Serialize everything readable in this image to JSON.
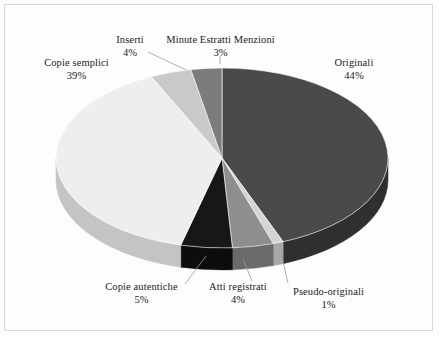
{
  "chart_data": {
    "type": "pie",
    "title": "",
    "subtitle": "",
    "xlabel": "",
    "ylabel": "",
    "legend_position": "none",
    "grid": false,
    "three_d": true,
    "start_angle_deg": 0,
    "direction": "clockwise",
    "units": "percent",
    "categories": [
      "Originali",
      "Pseudo-originali",
      "Atti registrati",
      "Copie autentiche",
      "Copie semplici",
      "Inserti",
      "Minute Estratti Menzioni"
    ],
    "values": [
      44,
      1,
      4,
      5,
      39,
      4,
      3
    ],
    "slices": [
      {
        "label": "Originali",
        "pct_text": "44%",
        "value": 44,
        "color": "#4a4a4a",
        "side_color": "#2f2f2f"
      },
      {
        "label": "Pseudo-originali",
        "pct_text": "1%",
        "value": 1,
        "color": "#d4d4d4",
        "side_color": "#a8a8a8"
      },
      {
        "label": "Atti registrati",
        "pct_text": "4%",
        "value": 4,
        "color": "#8e8e8e",
        "side_color": "#6a6a6a"
      },
      {
        "label": "Copie autentiche",
        "pct_text": "5%",
        "value": 5,
        "color": "#171717",
        "side_color": "#0d0d0d"
      },
      {
        "label": "Copie semplici",
        "pct_text": "39%",
        "value": 39,
        "color": "#eeeeee",
        "side_color": "#c4c4c4"
      },
      {
        "label": "Inserti",
        "pct_text": "4%",
        "value": 4,
        "color": "#c9c9c9",
        "side_color": "#a0a0a0"
      },
      {
        "label": "Minute Estratti Menzioni",
        "pct_text": "3%",
        "value": 3,
        "color": "#7c7c7c",
        "side_color": "#5a5a5a"
      }
    ]
  },
  "labels": {
    "originali": {
      "name": "Originali",
      "pct": "44%"
    },
    "pseudo_originali": {
      "name": "Pseudo-originali",
      "pct": "1%"
    },
    "atti_registrati": {
      "name": "Atti registrati",
      "pct": "4%"
    },
    "copie_autentiche": {
      "name": "Copie autentiche",
      "pct": "5%"
    },
    "copie_semplici": {
      "name": "Copie semplici",
      "pct": "39%"
    },
    "inserti": {
      "name": "Inserti",
      "pct": "4%"
    },
    "minute_estratti_menzioni": {
      "name": "Minute Estratti Menzioni",
      "pct": "3%"
    }
  }
}
